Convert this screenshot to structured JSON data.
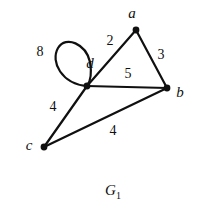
{
  "figure": {
    "caption_base": "G",
    "caption_subscript": "1",
    "background_color": "#ffffff",
    "ink_color": "#101010",
    "width": 200,
    "height": 206
  },
  "graph": {
    "type": "weighted-undirected-graph-with-loop",
    "stroke_color": "#101010",
    "stroke_width": 2.2,
    "vertex_radius": 3.4,
    "vertices": [
      {
        "id": "a",
        "label": "a",
        "x": 136,
        "y": 30,
        "label_x": 132,
        "label_y": 13
      },
      {
        "id": "b",
        "label": "b",
        "x": 167,
        "y": 88,
        "label_x": 180,
        "label_y": 92
      },
      {
        "id": "c",
        "label": "c",
        "x": 44,
        "y": 147,
        "label_x": 29,
        "label_y": 145
      },
      {
        "id": "d",
        "label": "d",
        "x": 87,
        "y": 86,
        "label_x": 90,
        "label_y": 63
      }
    ],
    "edges": [
      {
        "id": "a-d",
        "from": "a",
        "to": "d",
        "weight": "2",
        "label_x": 110,
        "label_y": 41
      },
      {
        "id": "a-b",
        "from": "a",
        "to": "b",
        "weight": "3",
        "label_x": 161,
        "label_y": 55
      },
      {
        "id": "d-b",
        "from": "d",
        "to": "b",
        "weight": "5",
        "label_x": 128,
        "label_y": 74
      },
      {
        "id": "d-c",
        "from": "d",
        "to": "c",
        "weight": "4",
        "label_x": 53,
        "label_y": 107
      },
      {
        "id": "c-b",
        "from": "c",
        "to": "b",
        "weight": "4",
        "label_x": 113,
        "label_y": 131
      }
    ],
    "loops": [
      {
        "id": "d-d",
        "at": "d",
        "weight": "8",
        "label_x": 40,
        "label_y": 52,
        "path": "M 87 86 C 62 84 50 62 58 48 C 66 35 86 44 90 62 C 92 74 90 82 87 86 Z"
      }
    ]
  }
}
